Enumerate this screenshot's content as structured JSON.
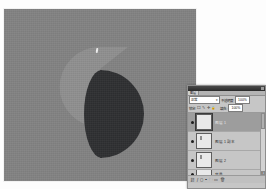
{
  "document": {
    "canvas_background": "#828282",
    "shapes": [
      {
        "name": "light-half-disc",
        "color": "#8f8f8f"
      },
      {
        "name": "dark-half-disc",
        "color": "#2e2f31"
      }
    ]
  },
  "layers_panel": {
    "title": "图层",
    "tab_label": "图层",
    "close_label": "×",
    "blend_mode": {
      "value": "正常",
      "chevron": "▾"
    },
    "opacity": {
      "label": "不透明度:",
      "value": "100%"
    },
    "lock": {
      "label": "锁定:",
      "icons": [
        "☐",
        "✎",
        "✛",
        "🔒"
      ],
      "icon_names": [
        "lock-transparency-icon",
        "lock-image-icon",
        "lock-position-icon",
        "lock-all-icon"
      ]
    },
    "fill": {
      "label": "填充:",
      "value": "100%"
    },
    "layers": [
      {
        "name": "图层 1",
        "visible": true,
        "selected": true,
        "thumb_mark": false
      },
      {
        "name": "图层 1 副本",
        "visible": true,
        "selected": false,
        "thumb_mark": true
      },
      {
        "name": "图层 2",
        "visible": true,
        "selected": false,
        "thumb_mark": true
      },
      {
        "name": "背景",
        "visible": true,
        "selected": false,
        "thumb_mark": false
      }
    ],
    "scrollbar": {
      "up_arrow": "▴",
      "down_arrow": "▾"
    },
    "footer_buttons": [
      {
        "name": "link-layers-button",
        "glyph": "⛓"
      },
      {
        "name": "layer-style-button",
        "glyph": "ƒ"
      },
      {
        "name": "layer-mask-button",
        "glyph": "◻"
      },
      {
        "name": "new-fill-layer-button",
        "glyph": "◓"
      },
      {
        "name": "new-group-button",
        "glyph": "🗀"
      },
      {
        "name": "new-layer-button",
        "glyph": "▭"
      },
      {
        "name": "delete-layer-button",
        "glyph": "🗑"
      }
    ]
  }
}
